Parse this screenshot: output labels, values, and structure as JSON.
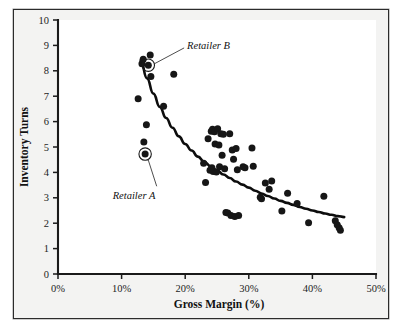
{
  "chart_data": {
    "type": "scatter",
    "title": "",
    "xlabel": "Gross Margin (%)",
    "ylabel": "Inventory Turns",
    "xlim": [
      0,
      50
    ],
    "ylim": [
      0,
      10
    ],
    "xticks": [
      0,
      10,
      20,
      30,
      40,
      50
    ],
    "xticklabels": [
      "0%",
      "10%",
      "20%",
      "30%",
      "40%",
      "50%"
    ],
    "yticks": [
      0,
      1,
      2,
      3,
      4,
      5,
      6,
      7,
      8,
      9,
      10
    ],
    "yticklabels": [
      "0",
      "1",
      "2",
      "3",
      "4",
      "5",
      "6",
      "7",
      "8",
      "9",
      "10"
    ],
    "grid": false,
    "legend": null,
    "legend_position": "none",
    "series": [
      {
        "name": "Retailers",
        "marker": "filled-circle",
        "color": "#161616",
        "points": [
          [
            12.6,
            6.9
          ],
          [
            13.2,
            8.28
          ],
          [
            13.4,
            8.45
          ],
          [
            13.5,
            5.2
          ],
          [
            13.7,
            4.72
          ],
          [
            13.9,
            5.88
          ],
          [
            14.2,
            8.22
          ],
          [
            14.5,
            8.62
          ],
          [
            14.6,
            7.78
          ],
          [
            16.6,
            6.6
          ],
          [
            18.2,
            7.86
          ],
          [
            22.9,
            4.36
          ],
          [
            23.2,
            3.6
          ],
          [
            23.6,
            5.32
          ],
          [
            23.9,
            4.08
          ],
          [
            24.1,
            5.62
          ],
          [
            24.2,
            4.18
          ],
          [
            24.3,
            5.7
          ],
          [
            24.4,
            4.04
          ],
          [
            24.6,
            5.6
          ],
          [
            24.7,
            5.12
          ],
          [
            24.9,
            4.02
          ],
          [
            25.1,
            5.72
          ],
          [
            25.3,
            5.08
          ],
          [
            25.4,
            4.22
          ],
          [
            25.6,
            5.52
          ],
          [
            25.8,
            4.68
          ],
          [
            26.0,
            5.5
          ],
          [
            26.2,
            4.14
          ],
          [
            26.4,
            2.42
          ],
          [
            26.7,
            2.4
          ],
          [
            27.0,
            5.52
          ],
          [
            27.2,
            2.3
          ],
          [
            27.4,
            4.88
          ],
          [
            27.6,
            4.52
          ],
          [
            27.8,
            2.26
          ],
          [
            28.0,
            4.94
          ],
          [
            28.2,
            4.1
          ],
          [
            28.4,
            2.3
          ],
          [
            29.1,
            4.22
          ],
          [
            29.4,
            4.18
          ],
          [
            30.5,
            4.96
          ],
          [
            30.7,
            4.24
          ],
          [
            31.8,
            3.02
          ],
          [
            32.0,
            2.96
          ],
          [
            32.6,
            3.58
          ],
          [
            33.2,
            3.34
          ],
          [
            33.6,
            3.66
          ],
          [
            35.2,
            2.48
          ],
          [
            36.1,
            3.18
          ],
          [
            37.6,
            2.78
          ],
          [
            39.4,
            2.02
          ],
          [
            41.8,
            3.06
          ],
          [
            43.6,
            2.1
          ],
          [
            43.9,
            1.94
          ],
          [
            44.2,
            1.82
          ],
          [
            44.4,
            1.72
          ]
        ]
      }
    ],
    "trend_curve": {
      "name": "power-fit trendline",
      "color": "#0d0d0d",
      "points": [
        [
          13.0,
          8.4
        ],
        [
          14.0,
          7.7
        ],
        [
          15.0,
          7.1
        ],
        [
          16.0,
          6.58
        ],
        [
          17.0,
          6.14
        ],
        [
          18.0,
          5.76
        ],
        [
          19.0,
          5.42
        ],
        [
          20.0,
          5.12
        ],
        [
          21.0,
          4.86
        ],
        [
          22.0,
          4.62
        ],
        [
          23.0,
          4.42
        ],
        [
          24.0,
          4.24
        ],
        [
          25.0,
          4.08
        ],
        [
          26.0,
          3.92
        ],
        [
          27.0,
          3.78
        ],
        [
          28.0,
          3.64
        ],
        [
          29.0,
          3.52
        ],
        [
          30.0,
          3.4
        ],
        [
          31.0,
          3.28
        ],
        [
          32.0,
          3.17
        ],
        [
          33.0,
          3.07
        ],
        [
          34.0,
          2.97
        ],
        [
          35.0,
          2.88
        ],
        [
          36.0,
          2.8
        ],
        [
          37.0,
          2.72
        ],
        [
          38.0,
          2.64
        ],
        [
          39.0,
          2.57
        ],
        [
          40.0,
          2.5
        ],
        [
          41.0,
          2.44
        ],
        [
          42.0,
          2.38
        ],
        [
          43.0,
          2.33
        ],
        [
          44.0,
          2.28
        ],
        [
          45.0,
          2.24
        ]
      ]
    },
    "annotations": [
      {
        "label": "Retailer B",
        "point": [
          14.2,
          8.22
        ],
        "label_x": 20.3,
        "label_y": 8.98,
        "highlighted": true
      },
      {
        "label": "Retailer A",
        "point": [
          13.7,
          4.72
        ],
        "label_x": 8.6,
        "label_y": 3.1,
        "highlighted": true
      }
    ]
  },
  "colors": {
    "marker": "#161616",
    "trend": "#0d0d0d",
    "axis": "#1a1a1a",
    "panel_bg": "#f3f3f2",
    "plot_bg": "#ffffff",
    "frame": "#2b2b2b"
  }
}
